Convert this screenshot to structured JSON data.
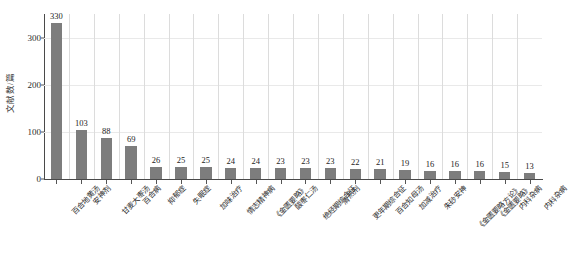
{
  "chart_data": {
    "type": "bar",
    "title": "",
    "subtitle": "",
    "xlabel": "",
    "ylabel": "文献数/篇",
    "ylim": [
      0,
      350
    ],
    "yticks": [
      0,
      100,
      200,
      300
    ],
    "ytick_labels": [
      "0",
      "100",
      "200",
      "300"
    ],
    "grid": "both-faint",
    "legend": "none",
    "bar_color": "#7d7d7d",
    "orientation": "vertical",
    "categories": [
      "百合地黄汤",
      "安神剂",
      "甘麦大枣汤",
      "百合病",
      "抑郁症",
      "失眠症",
      "加味治疗",
      "情志精神病",
      "《金匮要略》",
      "酸枣仁汤",
      "绝经期综合征",
      "清热剂",
      "更年期综合征",
      "百合知母汤",
      "加减治疗",
      "朱砂安神",
      "《金匮要略方论》",
      "《金匮要略》",
      "内科杂病",
      "内科杂病"
    ],
    "values": [
      330,
      103,
      88,
      69,
      26,
      25,
      25,
      24,
      24,
      23,
      23,
      23,
      22,
      21,
      19,
      16,
      16,
      16,
      15,
      13
    ],
    "value_labels": [
      "330",
      "103",
      "88",
      "69",
      "26",
      "25",
      "25",
      "24",
      "24",
      "23",
      "23",
      "23",
      "22",
      "21",
      "19",
      "16",
      "16",
      "16",
      "15",
      "13"
    ]
  }
}
